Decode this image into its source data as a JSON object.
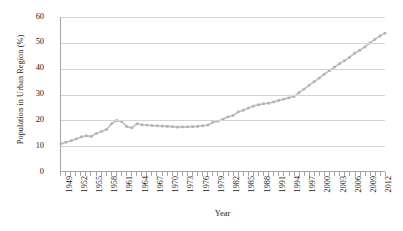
{
  "chart_data": {
    "type": "line",
    "title": "",
    "xlabel": "Year",
    "ylabel": "Population in Urban Region (%)",
    "xlim": [
      1949,
      2013
    ],
    "ylim": [
      0,
      60
    ],
    "yticks": [
      0,
      10,
      20,
      30,
      40,
      50,
      60
    ],
    "ytick_labels": [
      "0",
      "10",
      "20",
      "30",
      "40",
      "50",
      "60"
    ],
    "xtick_labels": [
      "1949",
      "1952",
      "1955",
      "1958",
      "1961",
      "1964",
      "1967",
      "1970",
      "1973",
      "1976",
      "1979",
      "1982",
      "1985",
      "1988",
      "1991",
      "1994",
      "1997",
      "2000",
      "2003",
      "2006",
      "2009",
      "2012"
    ],
    "xtick_label_step": 3,
    "xtick_label_rotation": 90,
    "grid": "horizontal",
    "legend": "none",
    "marker": "square",
    "marker_color": "#b3b3b3",
    "line_color": "#bfbfbf",
    "axis_color": "#a6a6a6",
    "gridline_color": "#d4d4d4",
    "text_color": "#1a1a1a",
    "x": [
      1949,
      1950,
      1951,
      1952,
      1953,
      1954,
      1955,
      1956,
      1957,
      1958,
      1959,
      1960,
      1961,
      1962,
      1963,
      1964,
      1965,
      1966,
      1967,
      1968,
      1969,
      1970,
      1971,
      1972,
      1973,
      1974,
      1975,
      1976,
      1977,
      1978,
      1979,
      1980,
      1981,
      1982,
      1983,
      1984,
      1985,
      1986,
      1987,
      1988,
      1989,
      1990,
      1991,
      1992,
      1993,
      1994,
      1995,
      1996,
      1997,
      1998,
      1999,
      2000,
      2001,
      2002,
      2003,
      2004,
      2005,
      2006,
      2007,
      2008,
      2009,
      2010,
      2011,
      2012,
      2013
    ],
    "values": [
      10.6,
      11.2,
      11.8,
      12.5,
      13.3,
      13.7,
      13.5,
      14.6,
      15.4,
      16.2,
      18.4,
      19.7,
      19.3,
      17.3,
      16.8,
      18.4,
      18.0,
      17.9,
      17.7,
      17.6,
      17.5,
      17.4,
      17.3,
      17.1,
      17.2,
      17.2,
      17.3,
      17.4,
      17.6,
      17.9,
      19.0,
      19.4,
      20.2,
      21.1,
      21.6,
      23.0,
      23.7,
      24.5,
      25.3,
      25.8,
      26.2,
      26.4,
      26.9,
      27.5,
      28.0,
      28.5,
      29.0,
      30.5,
      31.9,
      33.4,
      34.8,
      36.2,
      37.7,
      39.1,
      40.5,
      41.8,
      43.0,
      44.3,
      45.9,
      47.0,
      48.3,
      49.9,
      51.3,
      52.6,
      53.7
    ],
    "annotations": [
      {
        "label": "peak",
        "x": 1960,
        "y": 19.7
      },
      {
        "label": "trough",
        "x": 1963,
        "y": 16.8
      },
      {
        "label": "discontinuity",
        "x": 2000,
        "y": 36.2
      },
      {
        "label": "series-end",
        "x": 2013,
        "y": 53.7
      }
    ]
  }
}
